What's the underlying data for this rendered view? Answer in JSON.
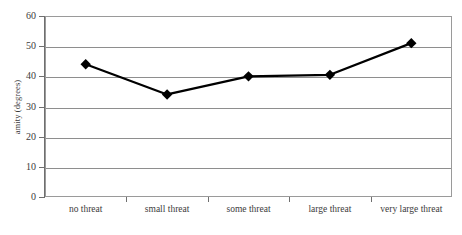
{
  "chart_data": {
    "type": "line",
    "title": "",
    "xlabel": "",
    "ylabel": "amity (degrees)",
    "categories": [
      "no threat",
      "small threat",
      "some threat",
      "large threat",
      "very large threat"
    ],
    "values": [
      44,
      34,
      40,
      40.5,
      51
    ],
    "series": [
      {
        "name": "amity",
        "values": [
          44,
          34,
          40,
          40.5,
          51
        ],
        "marker": "diamond",
        "marker_color": "#000000",
        "line_color": "#000000"
      }
    ],
    "ylim": [
      0,
      60
    ],
    "yticks": [
      0,
      10,
      20,
      30,
      40,
      50,
      60
    ],
    "ytick_labels": [
      "0",
      "10",
      "20",
      "30",
      "40",
      "50",
      "60"
    ],
    "grid": "horizontal",
    "legend": "none",
    "background_color": "#ffffff",
    "frame": "full-border"
  }
}
